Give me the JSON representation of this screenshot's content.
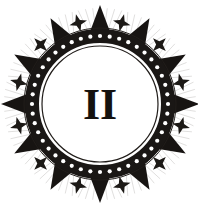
{
  "artwork": {
    "title": "Ornamental Roman Numeral Emblem",
    "style": "vintage engraving",
    "background_color": "#ffffff",
    "ink_color": "#14120f",
    "canvas": {
      "width": 198,
      "height": 208
    }
  },
  "center": {
    "glyph": "II",
    "glyph_name": "roman-numeral-two",
    "font_size": 44,
    "cx": 100,
    "cy": 104,
    "color": "#14120f"
  },
  "ring": {
    "name": "beaded-band",
    "cx": 100,
    "cy": 104,
    "outer_radius": 75,
    "inner_radius": 61,
    "band_color": "#1a1715",
    "bead_color": "#ffffff",
    "bead_count": 44,
    "bead_radius": 2.1,
    "bead_orbit_radius": 68,
    "inner_line_radius": 58,
    "inner_line_color": "#211d1a",
    "inner_line_width": 1.2,
    "outer_line_radius": 76,
    "outer_line_width": 1.0
  },
  "spikes": {
    "name": "triangular-spikes",
    "count": 12,
    "base_radius": 74,
    "tip_radius": 99,
    "half_width_deg": 7.5,
    "color": "#171412",
    "start_angle_deg": -90
  },
  "ornaments": {
    "name": "four-point-star-ornaments",
    "count": 12,
    "orbit_radius": 84,
    "size": 9,
    "color": "#1c1916",
    "offset_angle_deg": 15
  },
  "shading": {
    "name": "engraved-hatching",
    "count": 12,
    "inner_radius": 76,
    "outer_radius": 96,
    "color": "#6b6561",
    "opacity": 0.38,
    "stroke_width": 0.55,
    "lines_per_spike": 7
  }
}
